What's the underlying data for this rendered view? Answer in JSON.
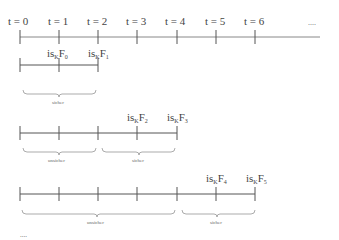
{
  "timeline": {
    "labels": [
      "t = 0",
      "t = 1",
      "t = 2",
      "t = 3",
      "t = 4",
      "t = 5",
      "t = 6"
    ],
    "ellipsis": "...."
  },
  "rows": [
    {
      "events": [
        {
          "prefix": "is",
          "sub": "K",
          "F": "F",
          "index": "0"
        },
        {
          "prefix": "is",
          "sub": "K",
          "F": "F",
          "index": "1"
        }
      ],
      "braces": [
        {
          "label": "sicher"
        }
      ]
    },
    {
      "events": [
        {
          "prefix": "is",
          "sub": "K",
          "F": "F",
          "index": "2"
        },
        {
          "prefix": "is",
          "sub": "K",
          "F": "F",
          "index": "3"
        }
      ],
      "braces": [
        {
          "label": "unsicher"
        },
        {
          "label": "sicher"
        }
      ]
    },
    {
      "events": [
        {
          "prefix": "is",
          "sub": "K",
          "F": "F",
          "index": "4"
        },
        {
          "prefix": "is",
          "sub": "K",
          "F": "F",
          "index": "5"
        }
      ],
      "braces": [
        {
          "label": "unsicher"
        },
        {
          "label": "sicher"
        }
      ]
    }
  ],
  "trailing_ellipsis": "...."
}
